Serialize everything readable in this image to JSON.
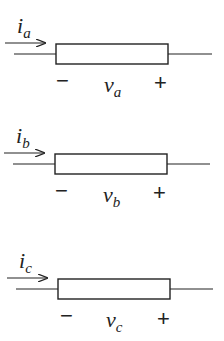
{
  "diagram": {
    "type": "circuit-elements",
    "elements": [
      {
        "id": "a",
        "current_label": "i",
        "current_sub": "a",
        "voltage_label": "v",
        "voltage_sub": "a",
        "minus": "−",
        "plus": "+",
        "y": 0
      },
      {
        "id": "b",
        "current_label": "i",
        "current_sub": "b",
        "voltage_label": "v",
        "voltage_sub": "b",
        "minus": "−",
        "plus": "+",
        "y": 110
      },
      {
        "id": "c",
        "current_label": "i",
        "current_sub": "c",
        "voltage_label": "v",
        "voltage_sub": "c",
        "minus": "−",
        "plus": "+",
        "y": 234
      }
    ],
    "colors": {
      "stroke": "#222222",
      "background": "#ffffff"
    }
  }
}
